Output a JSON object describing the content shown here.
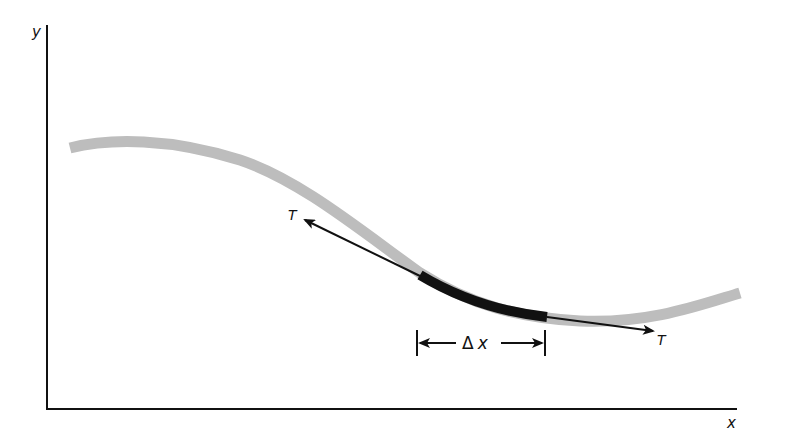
{
  "diagram": {
    "axes": {
      "y_label": "y",
      "x_label": "x"
    },
    "curve": {
      "description": "smooth gray curve (string shape)",
      "color": "#b8b8b8"
    },
    "segment": {
      "description": "highlighted black segment of the curve",
      "color": "#111111"
    },
    "tangents": {
      "left_label": "T",
      "right_label": "T"
    },
    "interval": {
      "delta_symbol": "Δ",
      "variable": "x"
    }
  }
}
